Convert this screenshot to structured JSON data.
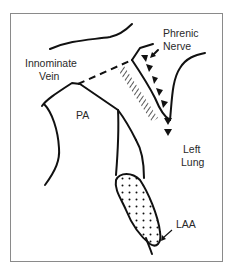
{
  "diagram": {
    "labels": {
      "innominate_vein_line1": "Innominate",
      "innominate_vein_line2": "Vein",
      "phrenic_nerve_line1": "Phrenic",
      "phrenic_nerve_line2": "Nerve",
      "pa": "PA",
      "left_lung_line1": "Left",
      "left_lung_line2": "Lung",
      "laa": "LAA"
    },
    "colors": {
      "line": "#111111",
      "frame": "#8a8a8a",
      "text": "#2a2a2a"
    }
  }
}
